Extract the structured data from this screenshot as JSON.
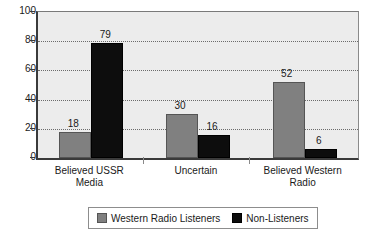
{
  "chart_data": {
    "type": "bar",
    "title": "",
    "subtitle": "",
    "xlabel": "",
    "ylabel": "",
    "categories": [
      "Believed USSR Media",
      "Uncertain",
      "Believed Western Radio"
    ],
    "category_lines": [
      [
        "Believed USSR",
        "Media"
      ],
      [
        "Uncertain",
        ""
      ],
      [
        "Believed Western",
        "Radio"
      ]
    ],
    "series": [
      {
        "name": "Western Radio Listeners",
        "values": [
          18,
          30,
          52
        ],
        "color": "#808080"
      },
      {
        "name": "Non-Listeners",
        "values": [
          79,
          16,
          6
        ],
        "color": "#0d0d0d"
      }
    ],
    "ylim": [
      0,
      100
    ],
    "yticks": [
      0,
      20,
      40,
      60,
      80,
      100
    ],
    "ytick_labels": [
      "0",
      "20",
      "40",
      "60",
      "80",
      "100"
    ],
    "grid": true,
    "grid_style": "dotted-horizontal",
    "legend_position": "bottom",
    "data_labels": true,
    "plot_background": "#ececec",
    "figure_background": "#ffffff"
  }
}
